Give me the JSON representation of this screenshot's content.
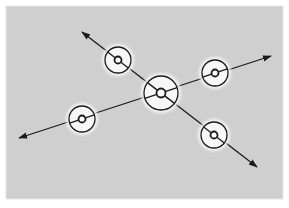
{
  "diagram": {
    "background": "#ffffff",
    "panel": {
      "x": 6,
      "y": 6,
      "width": 277,
      "height": 193,
      "fill": "#cfcfcf",
      "stroke": "#e6e6e6"
    },
    "stroke_color": "#1a1a1a",
    "glow_color": "#f4f4f4",
    "lines": [
      {
        "id": "line-a",
        "from": [
          82,
          32
        ],
        "to": [
          257,
          167
        ],
        "arrows": "both"
      },
      {
        "id": "line-b",
        "from": [
          19,
          138
        ],
        "to": [
          271,
          56
        ],
        "arrows": "both"
      }
    ],
    "nodes": [
      {
        "id": "node-center",
        "cx": 161,
        "cy": 93,
        "outer_r": 17,
        "inner_r": 4.5,
        "glow_r": 20
      },
      {
        "id": "node-upper-left",
        "cx": 118,
        "cy": 60,
        "outer_r": 13,
        "inner_r": 3.5,
        "glow_r": 16
      },
      {
        "id": "node-upper-right",
        "cx": 215,
        "cy": 73,
        "outer_r": 13,
        "inner_r": 3.5,
        "glow_r": 16
      },
      {
        "id": "node-lower-left",
        "cx": 82,
        "cy": 119,
        "outer_r": 13,
        "inner_r": 3.5,
        "glow_r": 16
      },
      {
        "id": "node-lower-right",
        "cx": 214,
        "cy": 135,
        "outer_r": 13,
        "inner_r": 3.5,
        "glow_r": 16
      }
    ]
  }
}
